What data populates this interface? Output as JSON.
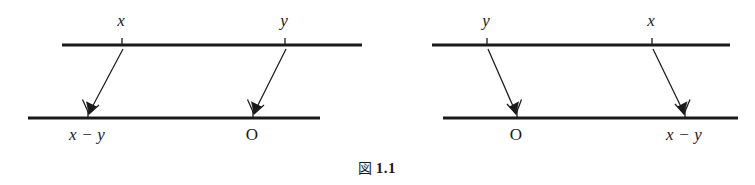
{
  "figure": {
    "caption_glyph": "図",
    "caption_number": "1.1",
    "caption_full": "図 1.1",
    "background_color": "#ffffff",
    "ink_color": "#1a1a1a",
    "panels": [
      {
        "id": "left-panel",
        "top_line": {
          "x1": 62,
          "x2": 362,
          "y": 45
        },
        "bottom_line": {
          "x1": 28,
          "x2": 320,
          "y": 118
        },
        "top_points": [
          {
            "label": "x",
            "style": "italic",
            "tick_x": 122,
            "label_x": 121,
            "label_y": 12
          },
          {
            "label": "y",
            "style": "italic",
            "tick_x": 285,
            "label_x": 284,
            "label_y": 12
          }
        ],
        "bottom_points": [
          {
            "label": "x − y",
            "style": "italic",
            "tick_x": 88,
            "label_x": 87,
            "label_y": 126
          },
          {
            "label": "O",
            "style": "upright",
            "tick_x": 253,
            "label_x": 252,
            "label_y": 126
          }
        ],
        "arrows": [
          {
            "from_x": 122,
            "from_y": 48,
            "to_x": 88,
            "to_y": 114,
            "direction": "down-left"
          },
          {
            "from_x": 285,
            "from_y": 48,
            "to_x": 253,
            "to_y": 114,
            "direction": "down-left"
          }
        ]
      },
      {
        "id": "right-panel",
        "top_line": {
          "x1": 432,
          "x2": 730,
          "y": 45
        },
        "bottom_line": {
          "x1": 443,
          "x2": 738,
          "y": 118
        },
        "top_points": [
          {
            "label": "y",
            "style": "italic",
            "tick_x": 487,
            "label_x": 486,
            "label_y": 12
          },
          {
            "label": "x",
            "style": "italic",
            "tick_x": 652,
            "label_x": 651,
            "label_y": 12
          }
        ],
        "bottom_points": [
          {
            "label": "O",
            "style": "upright",
            "tick_x": 517,
            "label_x": 516,
            "label_y": 126
          },
          {
            "label": "x − y",
            "style": "italic",
            "tick_x": 685,
            "label_x": 684,
            "label_y": 126
          }
        ],
        "arrows": [
          {
            "from_x": 487,
            "from_y": 48,
            "to_x": 517,
            "to_y": 114,
            "direction": "down-right"
          },
          {
            "from_x": 652,
            "from_y": 48,
            "to_x": 685,
            "to_y": 114,
            "direction": "down-right"
          }
        ]
      }
    ]
  }
}
